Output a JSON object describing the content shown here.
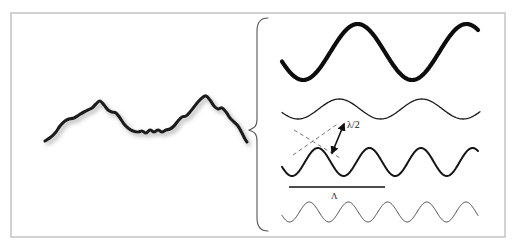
{
  "figure": {
    "background_color": "#ffffff",
    "frame": {
      "name": "outer-frame",
      "x": 11,
      "y": 13,
      "width": 494,
      "height": 224,
      "stroke_color": "#b4b4b4",
      "stroke_width": 1.2
    }
  },
  "annotations": [
    {
      "id": "lambda-half",
      "label": "λ/2",
      "x": 347,
      "y": 128,
      "font_size": 10,
      "color": "#111111",
      "description": "half-wavelength double arrow label"
    },
    {
      "id": "big-lambda",
      "label": "Λ",
      "x": 331,
      "y": 199,
      "font_size": 9,
      "color": "#111111",
      "description": "correlation length symbol above fine ripple"
    }
  ],
  "brace": {
    "name": "decomposition-brace",
    "top_y": 18,
    "bottom_y": 231,
    "tip_x": 249,
    "body_x": 268,
    "mid_y": 130,
    "stroke_color": "#555555",
    "stroke_width": 1.1
  },
  "rough_profile": {
    "name": "rough-surface-profile",
    "stroke_color": "#1a1a1a",
    "stroke_width": 3.2,
    "shadow_color": "#c9c9c9",
    "x_start": 45,
    "x_end": 247,
    "y_min": 95,
    "y_max": 142,
    "points": [
      [
        45,
        141
      ],
      [
        51,
        137
      ],
      [
        56,
        132
      ],
      [
        60,
        126
      ],
      [
        65,
        121
      ],
      [
        69,
        119
      ],
      [
        74,
        118
      ],
      [
        79,
        115
      ],
      [
        84,
        112
      ],
      [
        88,
        110
      ],
      [
        92,
        108
      ],
      [
        96,
        104
      ],
      [
        100,
        101
      ],
      [
        104,
        105
      ],
      [
        108,
        110
      ],
      [
        112,
        112
      ],
      [
        116,
        113
      ],
      [
        120,
        118
      ],
      [
        124,
        124
      ],
      [
        128,
        128
      ],
      [
        133,
        131
      ],
      [
        138,
        132
      ],
      [
        142,
        131
      ],
      [
        146,
        133
      ],
      [
        150,
        130
      ],
      [
        154,
        132
      ],
      [
        158,
        130
      ],
      [
        162,
        132
      ],
      [
        166,
        130
      ],
      [
        170,
        129
      ],
      [
        174,
        126
      ],
      [
        178,
        121
      ],
      [
        182,
        117
      ],
      [
        186,
        116
      ],
      [
        190,
        112
      ],
      [
        194,
        107
      ],
      [
        198,
        102
      ],
      [
        202,
        98
      ],
      [
        206,
        96
      ],
      [
        210,
        100
      ],
      [
        214,
        106
      ],
      [
        218,
        109
      ],
      [
        222,
        108
      ],
      [
        226,
        112
      ],
      [
        230,
        118
      ],
      [
        234,
        122
      ],
      [
        238,
        126
      ],
      [
        242,
        133
      ],
      [
        245,
        139
      ],
      [
        247,
        142
      ]
    ]
  },
  "waves": [
    {
      "id": "wave-1",
      "name": "harmonic-wave-long",
      "order": 1,
      "stroke_width": 4.2,
      "stroke_color": "#0d0d0d",
      "x_start": 282,
      "x_end": 478,
      "baseline_y": 52,
      "amplitude": 28,
      "periods": 1.8,
      "phase_deg": 200,
      "description": "longest wavelength component, thickest line"
    },
    {
      "id": "wave-2",
      "name": "harmonic-wave-medium",
      "order": 2,
      "stroke_width": 1.3,
      "stroke_color": "#1a1a1a",
      "x_start": 282,
      "x_end": 480,
      "baseline_y": 109,
      "amplitude": 10,
      "periods": 2.4,
      "phase_deg": 200,
      "description": "medium wavelength component, thin line"
    },
    {
      "id": "wave-3",
      "name": "harmonic-wave-short",
      "order": 3,
      "stroke_width": 2.0,
      "stroke_color": "#151515",
      "x_start": 282,
      "x_end": 478,
      "baseline_y": 162,
      "amplitude": 14,
      "periods": 3.8,
      "phase_deg": 200,
      "description": "short wavelength component, medium line, carries lambda/2 arrow"
    },
    {
      "id": "wave-4",
      "name": "harmonic-wave-fine",
      "order": 4,
      "stroke_width": 1.0,
      "stroke_color": "#4a4a4a",
      "x_start": 282,
      "x_end": 478,
      "baseline_y": 212,
      "amplitude": 10,
      "periods": 5.0,
      "phase_deg": 200,
      "description": "finest ripple component, thinnest line, carries Lambda label"
    }
  ],
  "scale_bar": {
    "name": "scale-bar",
    "x1": 289,
    "x2": 385,
    "y": 187,
    "stroke_color": "#111111",
    "stroke_width": 1.6
  },
  "dashed_guides": [
    {
      "id": "guide-left",
      "name": "dashed-guide-upper",
      "x1": 293,
      "y1": 155,
      "x2": 339,
      "y2": 123,
      "stroke_color": "#777777",
      "stroke_width": 1.0,
      "dash": "4 3"
    },
    {
      "id": "guide-lower",
      "name": "dashed-guide-lower",
      "x1": 294,
      "y1": 130,
      "x2": 340,
      "y2": 158,
      "stroke_color": "#777777",
      "stroke_width": 1.0,
      "dash": "4 3"
    }
  ],
  "double_arrow": {
    "name": "lambda-half-double-arrow",
    "x1": 332,
    "y1": 153,
    "x2": 344,
    "y2": 124,
    "stroke_color": "#111111",
    "stroke_width": 1.6
  }
}
